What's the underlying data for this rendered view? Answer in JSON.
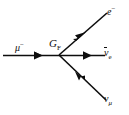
{
  "figure": {
    "kind": "feynman-diagram",
    "background_color": "#ffffff",
    "line_color": "#0d0d0d",
    "text_color": "#0d0d0d"
  },
  "vertex": {
    "label_main": "G",
    "label_sub": "F",
    "x": 59,
    "y": 55
  },
  "particles": {
    "incoming_muon": {
      "symbol": "μ",
      "charge": "−",
      "name": "muon",
      "direction": "right",
      "line": {
        "x1": 3,
        "y1": 55,
        "x2": 59,
        "y2": 55
      },
      "arrow_at": 0.66
    },
    "outgoing_electron": {
      "symbol": "e",
      "charge": "−",
      "name": "electron",
      "direction": "up-right",
      "line": {
        "x1": 59,
        "y1": 55,
        "x2": 106,
        "y2": 14
      },
      "arrow_at": 0.52
    },
    "incoming_antineutrino_e": {
      "symbol": "ν",
      "subscript": "e",
      "overline": true,
      "name": "electron antineutrino",
      "direction": "left",
      "line": {
        "x1": 59,
        "y1": 55,
        "x2": 104,
        "y2": 55
      },
      "arrow_at": 0.52
    },
    "outgoing_neutrino_mu": {
      "symbol": "ν",
      "subscript": "μ",
      "overline": false,
      "name": "muon neutrino",
      "direction": "down-right",
      "line": {
        "x1": 59,
        "y1": 55,
        "x2": 104,
        "y2": 99
      },
      "arrow_at": 0.52
    }
  }
}
